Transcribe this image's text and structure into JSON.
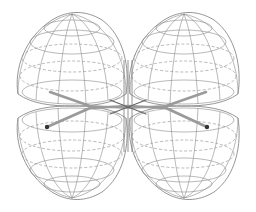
{
  "scene": {
    "description": "Wireframe 3D rendering of four d-orbital lobes with a central molecular stick model",
    "background": "#ffffff",
    "wire_color": "#8a8a8a",
    "bond_color": "#9a9a9a",
    "atom_color": "#333333",
    "lobes": [
      {
        "name": "top-left",
        "cx": 72,
        "cy": 62
      },
      {
        "name": "top-right",
        "cx": 184,
        "cy": 62
      },
      {
        "name": "bottom-left",
        "cx": 72,
        "cy": 150
      },
      {
        "name": "bottom-right",
        "cx": 184,
        "cy": 150
      }
    ]
  }
}
